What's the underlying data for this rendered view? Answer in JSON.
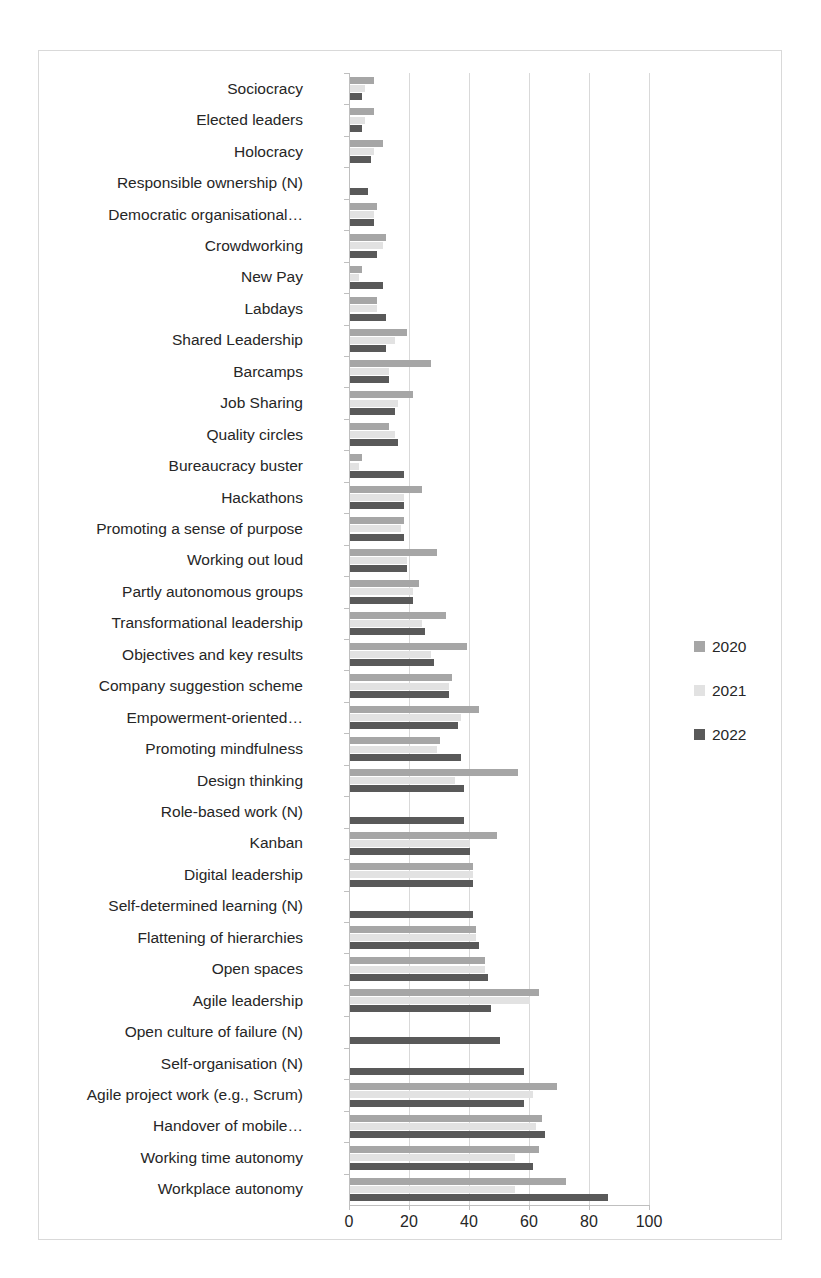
{
  "chart_data": {
    "type": "bar",
    "orientation": "horizontal",
    "title": "",
    "xlabel": "",
    "ylabel": "",
    "xlim": [
      0,
      100
    ],
    "xticks": [
      0,
      20,
      40,
      60,
      80,
      100
    ],
    "grid": true,
    "legend_position": "right",
    "series_colors": {
      "2020": "#a6a6a6",
      "2021": "#e2e2e2",
      "2022": "#595959"
    },
    "categories": [
      "Sociocracy",
      "Elected leaders",
      "Holocracy",
      "Responsible ownership (N)",
      "Democratic organisational…",
      "Crowdworking",
      "New Pay",
      "Labdays",
      "Shared Leadership",
      "Barcamps",
      "Job Sharing",
      "Quality circles",
      "Bureaucracy buster",
      "Hackathons",
      "Promoting a sense of purpose",
      "Working out loud",
      "Partly autonomous groups",
      "Transformational leadership",
      "Objectives and key results",
      "Company suggestion scheme",
      "Empowerment-oriented…",
      "Promoting mindfulness",
      "Design thinking",
      "Role-based work (N)",
      "Kanban",
      "Digital leadership",
      "Self-determined learning (N)",
      "Flattening of hierarchies",
      "Open spaces",
      "Agile leadership",
      "Open culture of failure (N)",
      "Self-organisation (N)",
      "Agile project work (e.g., Scrum)",
      "Handover of mobile…",
      "Working time autonomy",
      "Workplace autonomy"
    ],
    "series": [
      {
        "name": "2020",
        "values": [
          8,
          8,
          11,
          null,
          9,
          12,
          4,
          9,
          19,
          27,
          21,
          13,
          4,
          24,
          18,
          29,
          23,
          32,
          39,
          34,
          43,
          30,
          56,
          null,
          49,
          41,
          null,
          42,
          45,
          63,
          null,
          null,
          69,
          64,
          63,
          72
        ]
      },
      {
        "name": "2021",
        "values": [
          5,
          5,
          8,
          null,
          8,
          11,
          3,
          9,
          15,
          13,
          16,
          15,
          3,
          18,
          17,
          19,
          21,
          24,
          27,
          33,
          37,
          29,
          35,
          null,
          40,
          41,
          null,
          42,
          45,
          60,
          null,
          null,
          61,
          62,
          55,
          55
        ]
      },
      {
        "name": "2022",
        "values": [
          4,
          4,
          7,
          6,
          8,
          9,
          11,
          12,
          12,
          13,
          15,
          16,
          18,
          18,
          18,
          19,
          21,
          25,
          28,
          33,
          36,
          37,
          38,
          38,
          40,
          41,
          41,
          43,
          46,
          47,
          50,
          58,
          58,
          65,
          61,
          86
        ]
      }
    ]
  },
  "legend": {
    "entries": [
      {
        "label": "2020",
        "color": "#a6a6a6"
      },
      {
        "label": "2021",
        "color": "#e2e2e2"
      },
      {
        "label": "2022",
        "color": "#595959"
      }
    ]
  }
}
